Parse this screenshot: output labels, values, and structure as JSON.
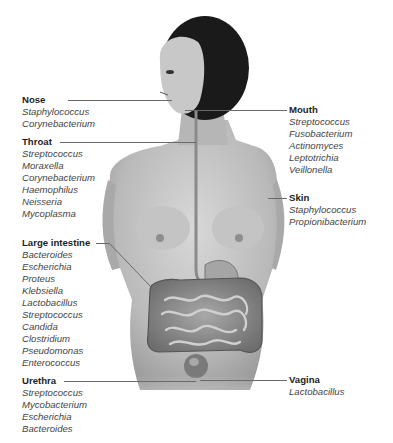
{
  "diagram": {
    "colors": {
      "text_title": "#1e1e1e",
      "text_item": "#444444",
      "leader_line": "#6a6a6a",
      "skin": "#c9c9c9",
      "hair": "#1a1a1a",
      "intestine": "#8f8f8f"
    },
    "regions": [
      {
        "id": "nose",
        "title": "Nose",
        "organisms": [
          "Staphylococcus",
          "Corynebacterium"
        ]
      },
      {
        "id": "throat",
        "title": "Throat",
        "organisms": [
          "Streptococcus",
          "Moraxella",
          "Corynebacterium",
          "Haemophilus",
          "Neisseria",
          "Mycoplasma"
        ]
      },
      {
        "id": "large-intestine",
        "title": "Large intestine",
        "organisms": [
          "Bacteroides",
          "Escherichia",
          "Proteus",
          "Klebsiella",
          "Lactobacillus",
          "Streptococcus",
          "Candida",
          "Clostridium",
          "Pseudomonas",
          "Enterococcus"
        ]
      },
      {
        "id": "urethra",
        "title": "Urethra",
        "organisms": [
          "Streptococcus",
          "Mycobacterium",
          "Escherichia",
          "Bacteroides"
        ]
      },
      {
        "id": "mouth",
        "title": "Mouth",
        "organisms": [
          "Streptococcus",
          "Fusobacterium",
          "Actinomyces",
          "Leptotrichia",
          "Veillonella"
        ]
      },
      {
        "id": "skin",
        "title": "Skin",
        "organisms": [
          "Staphylococcus",
          "Propionibacterium"
        ]
      },
      {
        "id": "vagina",
        "title": "Vagina",
        "organisms": [
          "Lactobacillus"
        ]
      }
    ]
  }
}
